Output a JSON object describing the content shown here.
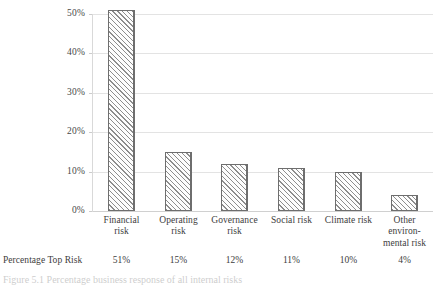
{
  "chart_data": {
    "type": "bar",
    "title": "",
    "subtitle": "",
    "xlabel": "",
    "ylabel": "",
    "categories": [
      "Financial risk",
      "Operating risk",
      "Governance risk",
      "Social risk",
      "Climate risk",
      "Other environ-mental risk"
    ],
    "category_lines": [
      [
        "Financial",
        "risk"
      ],
      [
        "Operating",
        "risk"
      ],
      [
        "Governance",
        "risk"
      ],
      [
        "Social risk"
      ],
      [
        "Climate risk"
      ],
      [
        "Other",
        "environ-",
        "mental risk"
      ]
    ],
    "values": [
      51,
      15,
      12,
      11,
      10,
      4
    ],
    "value_labels": [
      "51%",
      "15%",
      "12%",
      "11%",
      "10%",
      "4%"
    ],
    "ylim": [
      0,
      50
    ],
    "ytick_values": [
      0,
      10,
      20,
      30,
      40,
      50
    ],
    "ytick_labels": [
      "0%",
      "10%",
      "20%",
      "30%",
      "40%",
      "50%"
    ],
    "grid": true,
    "legend": "none",
    "series_name": "Percentage Top Risk",
    "bar_fill": "diagonal-hatch",
    "bar_edge_color": "#6e6e6e",
    "hatch_color": "#8d8d8d",
    "gridline_color": "#e3e3e3"
  },
  "table": {
    "row_label": "Percentage Top Risk",
    "values": [
      "51%",
      "15%",
      "12%",
      "11%",
      "10%",
      "4%"
    ]
  },
  "caption": {
    "text": "Figure 5.1  Percentage business response of all internal risks"
  }
}
